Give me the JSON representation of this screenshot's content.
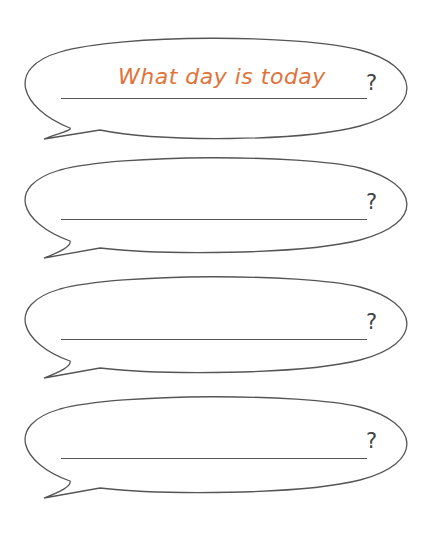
{
  "worksheet": {
    "bubbles": [
      {
        "answer": "What day is today",
        "end_mark": "?"
      },
      {
        "answer": "",
        "end_mark": "?"
      },
      {
        "answer": "",
        "end_mark": "?"
      },
      {
        "answer": "",
        "end_mark": "?"
      }
    ],
    "colors": {
      "answer_text": "#E0733A",
      "outline": "#555555",
      "background": "#FFFFFF"
    }
  }
}
